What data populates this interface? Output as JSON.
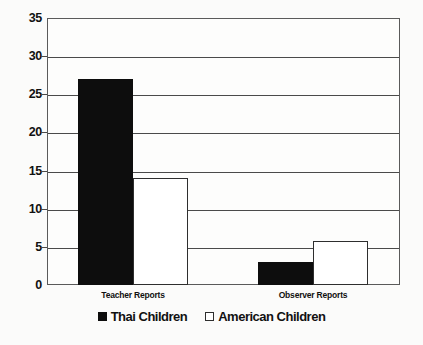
{
  "chart_data": {
    "type": "bar",
    "title": "",
    "xlabel": "",
    "ylabel": "",
    "ylim": [
      0,
      35
    ],
    "yticks": [
      0,
      5,
      10,
      15,
      20,
      25,
      30,
      35
    ],
    "ytick_labels": [
      "0",
      "5",
      "10",
      "15",
      "20",
      "25",
      "30",
      "35"
    ],
    "grid": true,
    "legend_position": "bottom-center",
    "grouping": "adjacent",
    "categories": [
      "Teacher Reports",
      "Observer Reports"
    ],
    "series": [
      {
        "name": "Thai Children",
        "values": [
          27,
          3
        ],
        "color": "#0d0d0d",
        "fill": "solid",
        "swatch": "filled-square"
      },
      {
        "name": "American Children",
        "values": [
          14,
          5.8
        ],
        "color": "#ffffff",
        "edge_color": "#2e2e2e",
        "fill": "open",
        "swatch": "outlined-square"
      }
    ]
  },
  "colors": {
    "background": "#fbfbfa",
    "plot_background": "#fdfdfc",
    "axis": "#4a4a4a",
    "text": "#111111",
    "series_thai": "#0d0d0d",
    "series_american": "#ffffff"
  }
}
